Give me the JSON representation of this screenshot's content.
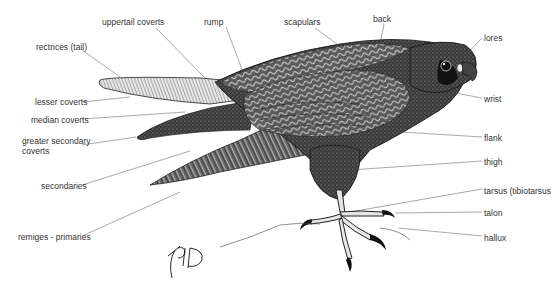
{
  "diagram": {
    "signature": "KPD",
    "colors": {
      "ink": "#1a1a1a",
      "leader": "#666666",
      "label_text": "#333333",
      "background": "#ffffff"
    },
    "labels": [
      {
        "id": "uppertail-coverts",
        "text": "uppertail coverts",
        "x": 102,
        "y": 17,
        "line": [
          [
            156,
            28
          ],
          [
            205,
            78
          ]
        ]
      },
      {
        "id": "rump",
        "text": "rump",
        "x": 204,
        "y": 17,
        "line": [
          [
            226,
            27
          ],
          [
            243,
            72
          ]
        ]
      },
      {
        "id": "scapulars",
        "text": "scapulars",
        "x": 284,
        "y": 17,
        "line": [
          [
            315,
            28
          ],
          [
            337,
            44
          ]
        ]
      },
      {
        "id": "back",
        "text": "back",
        "x": 373,
        "y": 14,
        "line": [
          [
            384,
            24
          ],
          [
            380,
            44
          ]
        ]
      },
      {
        "id": "lores",
        "text": "lores",
        "x": 484,
        "y": 33,
        "line": [
          [
            482,
            38
          ],
          [
            461,
            60
          ]
        ]
      },
      {
        "id": "rectrices-tail",
        "text": "rectrices (tail)",
        "x": 36,
        "y": 42,
        "line": [
          [
            82,
            50
          ],
          [
            120,
            77
          ]
        ]
      },
      {
        "id": "wrist",
        "text": "wrist",
        "x": 484,
        "y": 94,
        "line": [
          [
            482,
            98
          ],
          [
            450,
            92
          ]
        ]
      },
      {
        "id": "lesser-coverts",
        "text": "lesser coverts",
        "x": 35,
        "y": 97,
        "line": [
          [
            82,
            102
          ],
          [
            130,
            97
          ]
        ]
      },
      {
        "id": "median-coverts",
        "text": "median coverts",
        "x": 31,
        "y": 115,
        "line": [
          [
            82,
            119
          ],
          [
            185,
            112
          ]
        ]
      },
      {
        "id": "greater-secondary-coverts",
        "text": "greater secondary",
        "text2": "coverts",
        "x": 22,
        "y": 141,
        "line": [
          [
            82,
            145
          ],
          [
            136,
            137
          ]
        ]
      },
      {
        "id": "flank",
        "text": "flank",
        "x": 484,
        "y": 133,
        "line": [
          [
            482,
            137
          ],
          [
            385,
            131
          ]
        ]
      },
      {
        "id": "thigh",
        "text": "thigh",
        "x": 484,
        "y": 157,
        "line": [
          [
            482,
            161
          ],
          [
            350,
            170
          ]
        ]
      },
      {
        "id": "secondaries",
        "text": "secondaries",
        "x": 41,
        "y": 181,
        "line": [
          [
            82,
            185
          ],
          [
            190,
            151
          ]
        ]
      },
      {
        "id": "tarsus-tibiotarsus",
        "text": "tarsus (tibiotarsus",
        "x": 484,
        "y": 186,
        "line": [
          [
            482,
            189
          ],
          [
            350,
            212
          ]
        ]
      },
      {
        "id": "talon",
        "text": "talon",
        "x": 484,
        "y": 208,
        "line": [
          [
            482,
            212
          ],
          [
            395,
            213
          ]
        ]
      },
      {
        "id": "hallux",
        "text": "hallux",
        "x": 484,
        "y": 233,
        "line": [
          [
            482,
            236
          ],
          [
            398,
            228
          ]
        ]
      },
      {
        "id": "remiges-primaries",
        "text": "remiges - primaries",
        "x": 18,
        "y": 232,
        "line": [
          [
            82,
            236
          ],
          [
            180,
            192
          ]
        ]
      }
    ]
  }
}
